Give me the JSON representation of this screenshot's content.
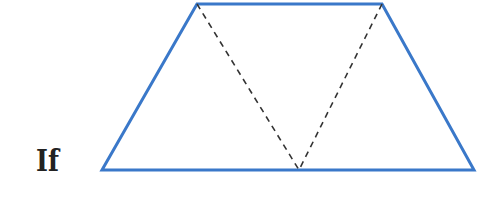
{
  "label": {
    "text": "If"
  },
  "figure": {
    "shape": "trapezoid",
    "outline_color": "#3a78c9",
    "dash_color": "#333333",
    "vertices": {
      "bottom_left": [
        102,
        170
      ],
      "top_left": [
        197,
        4
      ],
      "top_right": [
        382,
        4
      ],
      "bottom_right": [
        474,
        170
      ]
    },
    "dashed_apex": [
      299,
      170
    ]
  }
}
